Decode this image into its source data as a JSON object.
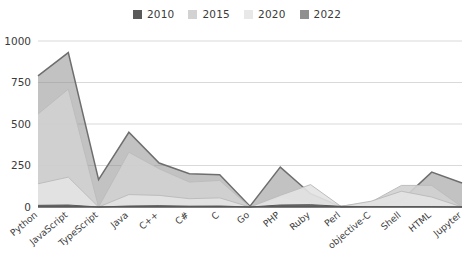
{
  "chart_data": {
    "type": "area",
    "title": "",
    "subtitle": "",
    "xlabel": "",
    "ylabel": "",
    "ylim": [
      0,
      1000
    ],
    "yticks": [
      0,
      250,
      500,
      750,
      1000
    ],
    "grid": true,
    "legend_position": "top-center",
    "stacked": false,
    "categories": [
      "Python",
      "JavaScript",
      "TypeScript",
      "Java",
      "C++",
      "C#",
      "C",
      "Go",
      "PHP",
      "Ruby",
      "Perl",
      "objective-C",
      "Shell",
      "HTML",
      "Jupyter"
    ],
    "series": [
      {
        "name": "2010",
        "color": "#5a5a5a",
        "values": [
          10,
          12,
          0,
          6,
          8,
          5,
          6,
          0,
          12,
          14,
          4,
          2,
          2,
          2,
          0
        ]
      },
      {
        "name": "2015",
        "color": "#d2d2d2",
        "values": [
          560,
          710,
          0,
          330,
          230,
          150,
          160,
          0,
          60,
          25,
          4,
          30,
          130,
          130,
          0
        ]
      },
      {
        "name": "2020",
        "color": "#e3e3e3",
        "values": [
          140,
          180,
          0,
          75,
          70,
          50,
          55,
          0,
          70,
          135,
          4,
          35,
          95,
          60,
          0
        ]
      },
      {
        "name": "2022",
        "color": "#909090",
        "values": [
          790,
          930,
          165,
          450,
          265,
          200,
          195,
          5,
          240,
          80,
          2,
          5,
          40,
          210,
          145
        ]
      }
    ]
  },
  "legend": {
    "items": [
      {
        "label": "2010",
        "color": "#5a5a5a"
      },
      {
        "label": "2015",
        "color": "#d2d2d2"
      },
      {
        "label": "2020",
        "color": "#e8e8e8"
      },
      {
        "label": "2022",
        "color": "#909090"
      }
    ]
  },
  "axes": {
    "y_tick_labels": [
      "1000",
      "750",
      "500",
      "250",
      "0"
    ],
    "x_tick_labels": [
      "Python",
      "JavaScript",
      "TypeScript",
      "Java",
      "C++",
      "C#",
      "C",
      "Go",
      "PHP",
      "Ruby",
      "Perl",
      "objective-C",
      "Shell",
      "HTML",
      "Jupyter"
    ]
  }
}
